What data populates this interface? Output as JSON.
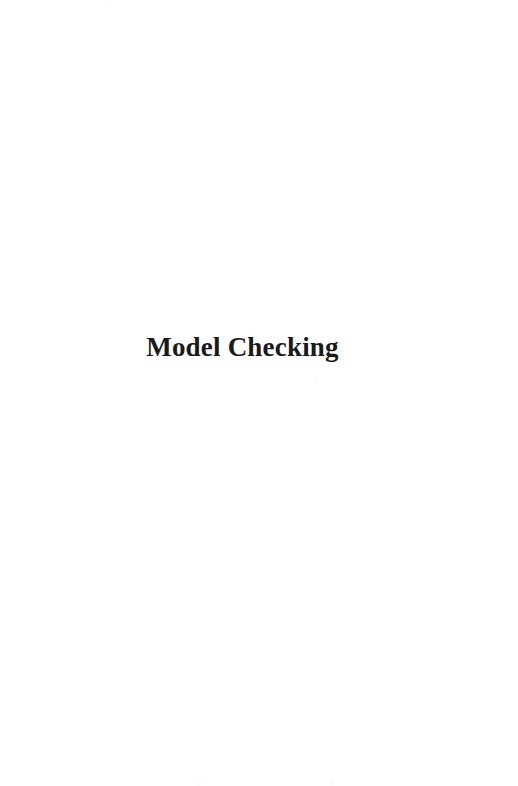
{
  "document": {
    "kind": "scanned-book-page",
    "page_type": "half-title",
    "background_color": "#ffffff",
    "ink_color": "#1a1a1a",
    "title": "Model Checking"
  },
  "artifacts": {
    "speckle_color": "#fbfbfb",
    "count": 4
  }
}
